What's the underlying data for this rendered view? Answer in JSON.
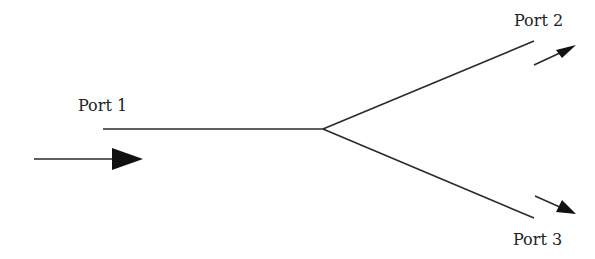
{
  "diagram": {
    "type": "Y-junction splitter",
    "ports": [
      {
        "id": "port1",
        "label": "Port 1",
        "role": "input"
      },
      {
        "id": "port2",
        "label": "Port 2",
        "role": "output"
      },
      {
        "id": "port3",
        "label": "Port 3",
        "role": "output"
      }
    ],
    "colors": {
      "line": "#2a2a2a",
      "arrow": "#111111",
      "background": "#ffffff"
    }
  }
}
